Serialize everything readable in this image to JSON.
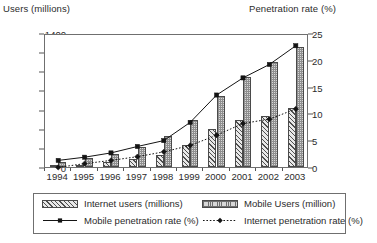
{
  "chart_data": {
    "type": "bar",
    "title": "",
    "xlabel": "",
    "ylabel": "Users (millions)",
    "y2label": "Penetration rate (%)",
    "categories": [
      "1994",
      "1995",
      "1996",
      "1997",
      "1998",
      "1999",
      "2000",
      "2001",
      "2002",
      "2003"
    ],
    "ylim": [
      0,
      1400
    ],
    "y2lim": [
      0,
      25
    ],
    "yticks": [
      0,
      200,
      400,
      600,
      800,
      1000,
      1200,
      1400
    ],
    "y2ticks": [
      0,
      5,
      10,
      15,
      20,
      25
    ],
    "grid": false,
    "legend_position": "bottom",
    "series": [
      {
        "name": "Internet users (millions)",
        "type": "bar",
        "axis": "left",
        "marker": "none",
        "style": "diagonal-hatch",
        "values": [
          5,
          20,
          50,
          85,
          130,
          230,
          400,
          490,
          530,
          620
        ]
      },
      {
        "name": "Mobile Users (million)",
        "type": "bar",
        "axis": "left",
        "marker": "none",
        "style": "dotted-fill",
        "values": [
          55,
          90,
          140,
          210,
          320,
          490,
          740,
          940,
          1100,
          1250
        ]
      },
      {
        "name": "Mobile penetration rate (%)",
        "type": "line",
        "axis": "right",
        "marker": "square",
        "style": "solid",
        "values": [
          1.6,
          2.2,
          3.0,
          4.2,
          5.3,
          8.7,
          13.8,
          17.0,
          19.5,
          23.0
        ]
      },
      {
        "name": "Internet penetration rate (%)",
        "type": "line",
        "axis": "right",
        "marker": "diamond",
        "style": "dotted",
        "values": [
          0.3,
          1.0,
          1.6,
          2.3,
          3.2,
          4.4,
          6.3,
          8.5,
          9.3,
          11.2
        ]
      }
    ]
  },
  "colors": {
    "axis": "#6f6f6f",
    "text": "#2b2b2b",
    "line": "#141414",
    "bar_internet_fill": "#e8e8e8",
    "bar_mobile_fill": "#d8d8d8",
    "background": "#ffffff"
  }
}
